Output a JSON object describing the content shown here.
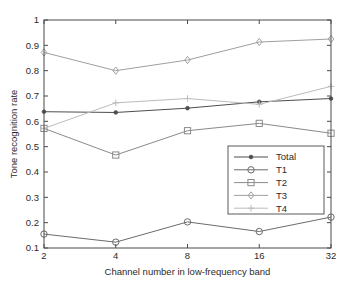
{
  "chart_data": {
    "type": "line",
    "title": "",
    "xlabel": "Channel number in low-frequency band",
    "ylabel": "Tone recognition rate",
    "x": [
      2,
      4,
      8,
      16,
      32
    ],
    "categories": [
      "2",
      "4",
      "8",
      "16",
      "32"
    ],
    "xtick_labels": [
      "2",
      "4",
      "8",
      "16",
      "32"
    ],
    "ytick_labels": [
      "0.1",
      "0.2",
      "0.3",
      "0.4",
      "0.5",
      "0.6",
      "0.7",
      "0.8",
      "0.9",
      "1"
    ],
    "ytick_values": [
      0.1,
      0.2,
      0.3,
      0.4,
      0.5,
      0.6,
      0.7,
      0.8,
      0.9,
      1
    ],
    "ylim": [
      0.1,
      1.0
    ],
    "xscale": "log2-even-spaced",
    "grid": false,
    "legend_position": "lower-right-inside",
    "series": [
      {
        "name": "Total",
        "marker": "dot",
        "color": "#4d4d4d",
        "values": [
          0.638,
          0.635,
          0.652,
          0.677,
          0.69
        ]
      },
      {
        "name": "T1",
        "marker": "circle",
        "color": "#6b6b6b",
        "values": [
          0.155,
          0.123,
          0.203,
          0.165,
          0.222
        ]
      },
      {
        "name": "T2",
        "marker": "square",
        "color": "#8a8a8a",
        "values": [
          0.572,
          0.467,
          0.563,
          0.592,
          0.553
        ]
      },
      {
        "name": "T3",
        "marker": "diamond",
        "color": "#a0a0a0",
        "values": [
          0.872,
          0.8,
          0.842,
          0.913,
          0.925
        ]
      },
      {
        "name": "T4",
        "marker": "plus",
        "color": "#bcbcbc",
        "values": [
          0.572,
          0.673,
          0.69,
          0.667,
          0.738
        ]
      }
    ],
    "legend_entries": [
      "Total",
      "T1",
      "T2",
      "T3",
      "T4"
    ]
  }
}
